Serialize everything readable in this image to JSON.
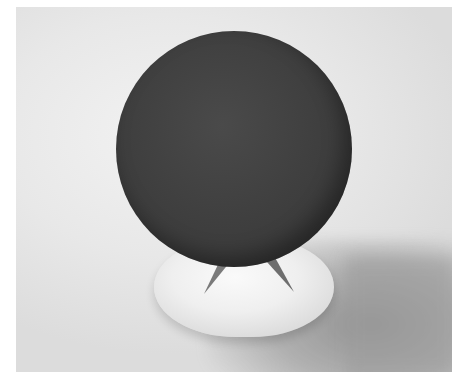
{
  "image": {
    "description": "Rendered scene of a large dark textured sphere resting on a small cone atop a white rounded pedestal, casting a soft shadow to the lower right on a light gray background",
    "colors": {
      "background": "#e8e8e8",
      "sphere": "#3f3f3f",
      "pedestal": "#efefef",
      "cone": "#7a7a7a",
      "shadow": "#9d9d9d",
      "border": "#ffffff"
    }
  }
}
